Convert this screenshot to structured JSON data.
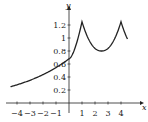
{
  "chart_data": {
    "type": "line",
    "title": "",
    "xlabel": "x",
    "ylabel": "y",
    "xlim": [
      -4.5,
      4.6
    ],
    "ylim": [
      0,
      1.35
    ],
    "grid": false,
    "x_ticks": [
      -4,
      -3,
      -2,
      -1,
      1,
      2,
      3,
      4
    ],
    "x_tick_labels": [
      "−4",
      "−3",
      "−2",
      "−1",
      "1",
      "2",
      "3",
      "4"
    ],
    "y_ticks": [
      0.2,
      0.4,
      0.6,
      0.8,
      1,
      1.2
    ],
    "y_tick_labels": [
      "0.2",
      "0.4",
      "0.6",
      "0.8",
      "1",
      "1.2"
    ],
    "series": [
      {
        "name": "f(x)",
        "x": [
          -4.5,
          -4,
          -3,
          -2,
          -1,
          -0.5,
          0,
          0.5,
          1,
          1.5,
          2,
          2.5,
          3,
          3.5,
          4,
          4.5
        ],
        "values": [
          0.25,
          0.27,
          0.32,
          0.38,
          0.48,
          0.56,
          0.68,
          0.88,
          1.25,
          0.98,
          0.84,
          0.8,
          0.84,
          0.98,
          1.25,
          0.8
        ]
      }
    ]
  },
  "axes": {
    "x_label": "x",
    "y_label": "y"
  }
}
